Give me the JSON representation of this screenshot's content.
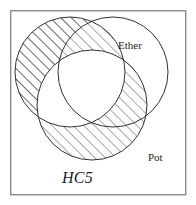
{
  "diagram": {
    "type": "venn-3-circle",
    "title_label": "HC5",
    "frame": {
      "x": 10,
      "y": 10,
      "width": 176,
      "height": 185,
      "stroke": "#8a8a8a",
      "stroke_width": 1.4
    },
    "background": "#ffffff",
    "stroke_color": "#1b1b1b",
    "stroke_width": 0.9,
    "hatch": {
      "angle_deg": 45,
      "spacing": 7.5,
      "color": "#1b1b1b",
      "width": 0.7,
      "direction": "lower-left-to-upper-right"
    },
    "circles": [
      {
        "id": "left",
        "label": "",
        "cx": 70,
        "cy": 72,
        "r": 55,
        "hatched": true
      },
      {
        "id": "ether",
        "label": "Ether",
        "cx": 113,
        "cy": 72,
        "r": 55,
        "hatched": false
      },
      {
        "id": "pot",
        "label": "Pot",
        "cx": 92,
        "cy": 105,
        "r": 55,
        "hatched": true
      }
    ],
    "labels": {
      "ether": "Ether",
      "pot": "Pot",
      "hc5": "HC5"
    },
    "shaded_regions": [
      "left-only",
      "left-and-ether-not-pot",
      "left-and-pot-not-ether-partial",
      "ether-and-pot-not-left",
      "pot-only"
    ],
    "unshaded_regions": [
      "ether-only",
      "left-and-pot-not-ether",
      "triple-intersection"
    ]
  }
}
